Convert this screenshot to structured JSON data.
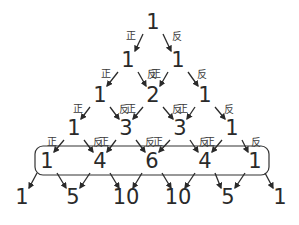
{
  "labels": {
    "heads": "正",
    "tails": "反"
  },
  "colors": {
    "ink": "#2a2a2a",
    "background": "#ffffff"
  },
  "rows": [
    {
      "y": 22,
      "items": [
        {
          "x": 153,
          "value": "1"
        }
      ],
      "show_labels": true
    },
    {
      "y": 60,
      "items": [
        {
          "x": 128,
          "value": "1"
        },
        {
          "x": 178,
          "value": "1"
        }
      ],
      "show_labels": true
    },
    {
      "y": 95,
      "items": [
        {
          "x": 100,
          "value": "1"
        },
        {
          "x": 153,
          "value": "2"
        },
        {
          "x": 205,
          "value": "1"
        }
      ],
      "show_labels": true
    },
    {
      "y": 128,
      "items": [
        {
          "x": 74,
          "value": "1"
        },
        {
          "x": 126,
          "value": "3"
        },
        {
          "x": 180,
          "value": "3"
        },
        {
          "x": 232,
          "value": "1"
        }
      ],
      "show_labels": true
    },
    {
      "y": 161,
      "items": [
        {
          "x": 47,
          "value": "1"
        },
        {
          "x": 100,
          "value": "4"
        },
        {
          "x": 152,
          "value": "6"
        },
        {
          "x": 205,
          "value": "4"
        },
        {
          "x": 255,
          "value": "1"
        }
      ],
      "show_labels": false,
      "highlighted": true
    },
    {
      "y": 197,
      "items": [
        {
          "x": 22,
          "value": "1"
        },
        {
          "x": 73,
          "value": "5"
        },
        {
          "x": 126,
          "value": "10"
        },
        {
          "x": 178,
          "value": "10"
        },
        {
          "x": 228,
          "value": "5"
        },
        {
          "x": 280,
          "value": "1"
        }
      ],
      "show_labels": false
    }
  ],
  "highlight_box": {
    "x": 35,
    "y": 146,
    "width": 234,
    "height": 29,
    "radius": 8
  }
}
